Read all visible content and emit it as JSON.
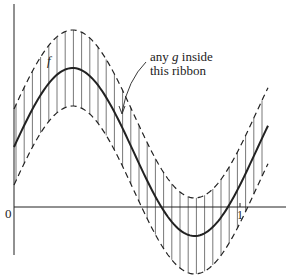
{
  "figure": {
    "annotation": {
      "line1_pre": "any ",
      "line1_var": "g",
      "line1_post": " inside",
      "line2": "this ribbon"
    },
    "curve_label": "f",
    "axis": {
      "origin_label": "0",
      "x_tick_label": "1"
    },
    "colors": {
      "ink": "#222222",
      "hatch": "#555555"
    }
  },
  "chart_data": {
    "type": "line",
    "title": "",
    "xlabel": "",
    "ylabel": "",
    "x_ticks": [
      "0",
      "1"
    ],
    "series": [
      {
        "name": "f",
        "style": "solid"
      },
      {
        "name": "f + epsilon",
        "style": "dashed"
      },
      {
        "name": "f - epsilon",
        "style": "dashed"
      }
    ],
    "annotations": [
      "f",
      "any g inside this ribbon"
    ]
  }
}
